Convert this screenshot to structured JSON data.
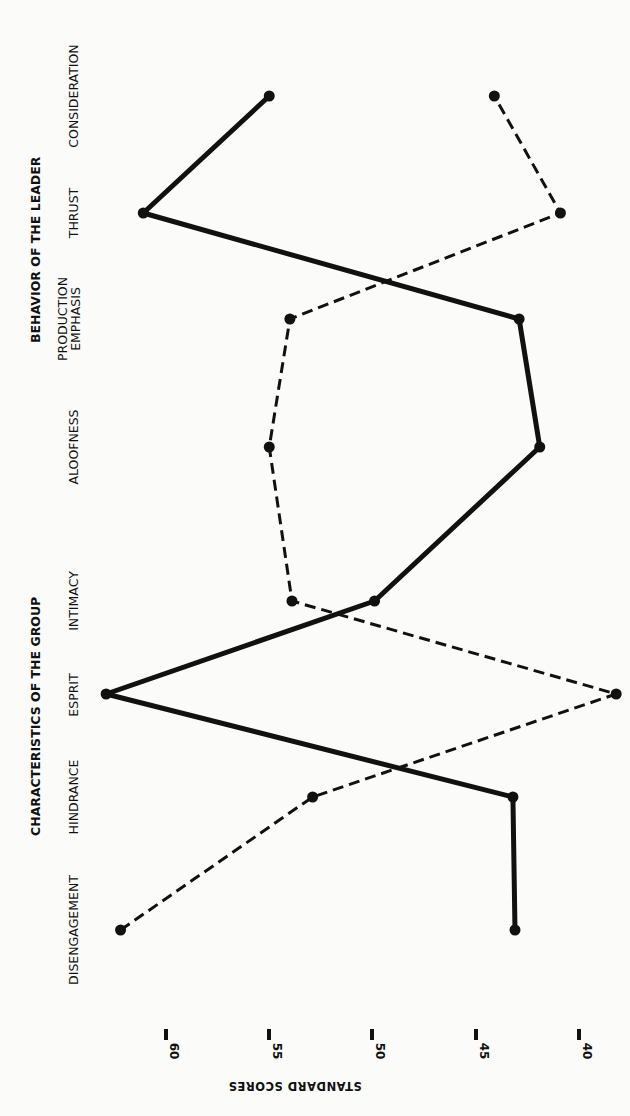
{
  "chart_data": {
    "type": "line",
    "orientation": "rotated-90-ccw",
    "title": "",
    "category_groups": [
      {
        "label": "CHARACTERISTICS OF THE GROUP",
        "categories": [
          "DISENGAGEMENT",
          "HINDRANCE",
          "ESPRIT",
          "INTIMACY"
        ]
      },
      {
        "label": "BEHAVIOR OF THE LEADER",
        "categories": [
          "ALOOFNESS",
          "PRODUCTION EMPHASIS",
          "THRUST",
          "CONSIDERATION"
        ]
      }
    ],
    "categories": [
      "DISENGAGEMENT",
      "HINDRANCE",
      "ESPRIT",
      "INTIMACY",
      "ALOOFNESS",
      "PRODUCTION EMPHASIS",
      "THRUST",
      "CONSIDERATION"
    ],
    "series": [
      {
        "name": "Solid line profile",
        "style": "solid",
        "values": [
          43.1,
          43.2,
          62.9,
          49.9,
          41.9,
          42.9,
          61.1,
          55.0
        ]
      },
      {
        "name": "Dashed line profile",
        "style": "dashed",
        "values": [
          62.2,
          52.9,
          38.2,
          53.9,
          55.0,
          54.0,
          40.9,
          44.1
        ]
      }
    ],
    "xlabel": "",
    "ylabel": "STANDARD SCORES",
    "yticks": [
      60,
      55,
      50,
      45,
      40
    ],
    "ylim": [
      38,
      63
    ],
    "grid": false,
    "legend": "none"
  },
  "labels": {
    "group1": "CHARACTERISTICS OF THE GROUP",
    "group2": "BEHAVIOR OF THE LEADER",
    "cat0": "DISENGAGEMENT",
    "cat1": "HINDRANCE",
    "cat2": "ESPRIT",
    "cat3": "INTIMACY",
    "cat4": "ALOOFNESS",
    "cat5a": "PRODUCTION",
    "cat5b": "EMPHASIS",
    "cat6": "THRUST",
    "cat7": "CONSIDERATION",
    "tick0": "60",
    "tick1": "55",
    "tick2": "50",
    "tick3": "45",
    "tick4": "40",
    "axis_title": "STANDARD SCORES"
  }
}
